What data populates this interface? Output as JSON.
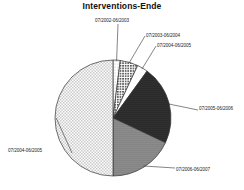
{
  "chart": {
    "title": "Interventions-Ende"
  },
  "chart_data": {
    "type": "pie",
    "title": "Interventions-Ende",
    "xlabel": "",
    "ylabel": "",
    "legend_position": "none",
    "grid": false,
    "labels_outside": true,
    "start_angle_deg": -90,
    "direction": "clockwise",
    "categories": [
      "07/2002-06/2003",
      "07/2003-06/2004",
      "07/2004-06/2005",
      "07/2005-06/2006",
      "07/2006-06/2007",
      "07/2004-06/2005"
    ],
    "slices": [
      {
        "label": "07/2002-06/2003",
        "percent": 2.0,
        "angle_deg": 7.2,
        "fill": "light-dots",
        "color": "#f2f2f2"
      },
      {
        "label": "07/2003-06/2004",
        "percent": 5.0,
        "angle_deg": 18.0,
        "fill": "coarse-dots",
        "color": "#9a9a9a"
      },
      {
        "label": "07/2004-06/2005",
        "percent": 3.0,
        "angle_deg": 10.8,
        "fill": "white",
        "color": "#ffffff"
      },
      {
        "label": "07/2005-06/2006",
        "percent": 22.0,
        "angle_deg": 79.2,
        "fill": "solid-dark",
        "color": "#2b2b2b"
      },
      {
        "label": "07/2006-06/2007",
        "percent": 18.0,
        "angle_deg": 64.8,
        "fill": "mid-gray",
        "color": "#8c8c8c"
      },
      {
        "label": "07/2004-06/2005",
        "percent": 50.0,
        "angle_deg": 180.0,
        "fill": "fine-dots",
        "color": "#e8e8e8"
      }
    ],
    "values": [
      2.0,
      5.0,
      3.0,
      22.0,
      18.0,
      50.0
    ],
    "outline_color": "#333333"
  }
}
